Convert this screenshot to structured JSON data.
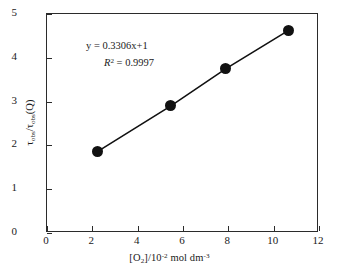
{
  "chart_data": {
    "type": "scatter",
    "title": "",
    "xlabel": "[O2]/10-2 mol dm-3",
    "ylabel": "tau_obs/tau_obs(Q)",
    "xlim": [
      0,
      12
    ],
    "ylim": [
      0,
      5
    ],
    "grid": false,
    "legend": null,
    "x": [
      2.25,
      5.51,
      7.94,
      10.72
    ],
    "y": [
      1.83,
      2.88,
      3.73,
      4.61
    ],
    "series": [
      {
        "name": "tau ratio vs oxygen concentration",
        "marker": "filled-circle",
        "marker_color": "#111111",
        "line_color": "#111111",
        "points": [
          {
            "x": 2.25,
            "y": 1.83
          },
          {
            "x": 5.51,
            "y": 2.88
          },
          {
            "x": 7.94,
            "y": 3.73
          },
          {
            "x": 10.72,
            "y": 4.61
          }
        ]
      }
    ],
    "fit": {
      "slope": 0.3306,
      "intercept": 1,
      "r_squared": 0.9997,
      "equation_text": "y = 0.3306x+1",
      "r2_text": "= 0.9997"
    },
    "annotations": [
      {
        "id": "equation",
        "text": "y = 0.3306x+1"
      },
      {
        "id": "r-squared",
        "text": "R2 = 0.9997"
      }
    ],
    "xticks": [
      0,
      2,
      4,
      6,
      8,
      10,
      12
    ],
    "yticks": [
      0,
      1,
      2,
      3,
      4,
      5
    ],
    "xtick_labels": [
      "0",
      "2",
      "4",
      "6",
      "8",
      "10",
      "12"
    ],
    "ytick_labels": [
      "0",
      "1",
      "2",
      "3",
      "4",
      "5"
    ]
  },
  "axes": {
    "x_title_parts": {
      "bracket_open": "[O",
      "species_sub": "2",
      "bracket_close": "]/10",
      "exponent": "-2",
      "units": " mol dm",
      "units_exponent": "-3"
    },
    "y_title_parts": {
      "tau1": "τ",
      "sub1": "obs",
      "slash": "/",
      "tau2": "τ",
      "sub2": "obs",
      "paren": "(Q)"
    }
  },
  "annotation_text": {
    "equation": "y = 0.3306x+1",
    "r_symbol": "R",
    "r_exponent": "2",
    "r_value": "= 0.9997"
  },
  "colors": {
    "axis": "#2b2b2b",
    "marker": "#111111",
    "line": "#111111",
    "background": "#ffffff",
    "text": "#1a1a1a"
  }
}
